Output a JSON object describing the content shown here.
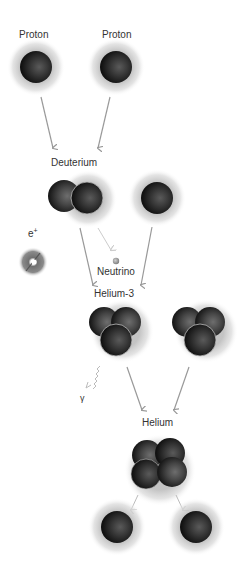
{
  "diagram": {
    "labels": {
      "proton_left": "Proton",
      "proton_right": "Proton",
      "deuterium": "Deuterium",
      "positron": "e",
      "positron_sup": "+",
      "neutrino": "Neutrino",
      "helium3": "Helium-3",
      "gamma": "γ",
      "helium": "Helium"
    },
    "stages": [
      {
        "name": "Proton",
        "count": 2
      },
      {
        "name": "Deuterium",
        "count": 1,
        "plus": "Proton"
      },
      {
        "name": "Helium-3",
        "count": 2
      },
      {
        "name": "Helium",
        "count": 1,
        "products": [
          "Proton",
          "Proton"
        ]
      }
    ],
    "byproducts": [
      "e+",
      "Neutrino",
      "γ"
    ],
    "colors": {
      "nucleon": "#2a2a2a",
      "halo": "#c8c8c8",
      "arrow": "#999999",
      "text": "#333333"
    }
  }
}
